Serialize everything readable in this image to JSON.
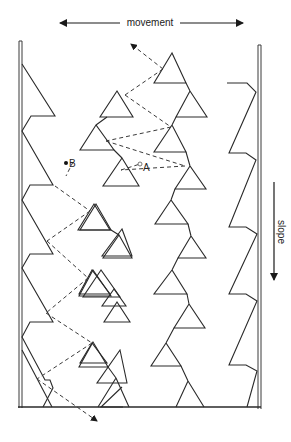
{
  "diagram": {
    "labels": {
      "movement": "movement",
      "slope": "slope",
      "point_a": "A",
      "point_b": "B"
    },
    "colors": {
      "line": "#2a2a2a",
      "background": "#ffffff"
    }
  }
}
